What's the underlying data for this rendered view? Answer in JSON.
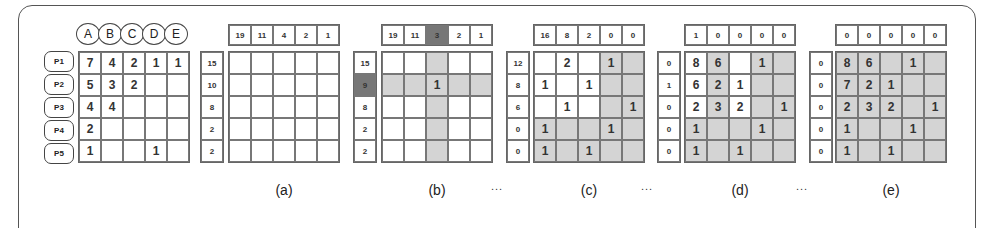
{
  "columns": [
    "A",
    "B",
    "C",
    "D",
    "E"
  ],
  "rows": [
    "P1",
    "P2",
    "P3",
    "P4",
    "P5"
  ],
  "input_matrix": [
    [
      "7",
      "4",
      "2",
      "1",
      "1"
    ],
    [
      "5",
      "3",
      "2",
      "",
      ""
    ],
    [
      "4",
      "4",
      "",
      "",
      ""
    ],
    [
      "2",
      "",
      "",
      "",
      ""
    ],
    [
      "1",
      "",
      "",
      "1",
      ""
    ]
  ],
  "panels": [
    {
      "label": "(a)",
      "col_sums": [
        "19",
        "11",
        "4",
        "2",
        "1"
      ],
      "row_sums": [
        "15",
        "10",
        "8",
        "2",
        "2"
      ],
      "col_highlight": -1,
      "row_highlight": -1,
      "cells": [
        [
          "",
          "",
          "",
          "",
          ""
        ],
        [
          "",
          "",
          "",
          "",
          ""
        ],
        [
          "",
          "",
          "",
          "",
          ""
        ],
        [
          "",
          "",
          "",
          "",
          ""
        ],
        [
          "",
          "",
          "",
          "",
          ""
        ]
      ],
      "shaded": [
        [
          0,
          0,
          0,
          0,
          0
        ],
        [
          0,
          0,
          0,
          0,
          0
        ],
        [
          0,
          0,
          0,
          0,
          0
        ],
        [
          0,
          0,
          0,
          0,
          0
        ],
        [
          0,
          0,
          0,
          0,
          0
        ]
      ]
    },
    {
      "label": "(b)",
      "col_sums": [
        "19",
        "11",
        "3",
        "2",
        "1"
      ],
      "row_sums": [
        "15",
        "9",
        "8",
        "2",
        "2"
      ],
      "col_highlight": 2,
      "row_highlight": 1,
      "cells": [
        [
          "",
          "",
          "",
          "",
          ""
        ],
        [
          "",
          "",
          "1",
          "",
          ""
        ],
        [
          "",
          "",
          "",
          "",
          ""
        ],
        [
          "",
          "",
          "",
          "",
          ""
        ],
        [
          "",
          "",
          "",
          "",
          ""
        ]
      ],
      "shaded": [
        [
          0,
          0,
          1,
          0,
          0
        ],
        [
          1,
          1,
          1,
          1,
          1
        ],
        [
          0,
          0,
          1,
          0,
          0
        ],
        [
          0,
          0,
          1,
          0,
          0
        ],
        [
          0,
          0,
          1,
          0,
          0
        ]
      ]
    },
    {
      "label": "(c)",
      "col_sums": [
        "16",
        "8",
        "2",
        "0",
        "0"
      ],
      "row_sums": [
        "12",
        "8",
        "6",
        "0",
        "0"
      ],
      "col_highlight": -1,
      "row_highlight": -1,
      "cells": [
        [
          "",
          "2",
          "",
          "1",
          ""
        ],
        [
          "1",
          "",
          "1",
          "",
          ""
        ],
        [
          "",
          "1",
          "",
          "",
          "1"
        ],
        [
          "1",
          "",
          "",
          "1",
          ""
        ],
        [
          "1",
          "",
          "1",
          "",
          ""
        ]
      ],
      "shaded": [
        [
          0,
          0,
          0,
          1,
          1
        ],
        [
          0,
          0,
          0,
          1,
          1
        ],
        [
          0,
          0,
          0,
          1,
          1
        ],
        [
          1,
          1,
          1,
          1,
          1
        ],
        [
          1,
          1,
          1,
          1,
          1
        ]
      ]
    },
    {
      "label": "(d)",
      "col_sums": [
        "1",
        "0",
        "0",
        "0",
        "0"
      ],
      "row_sums": [
        "0",
        "1",
        "0",
        "0",
        "0"
      ],
      "col_highlight": -1,
      "row_highlight": -1,
      "cells": [
        [
          "8",
          "6",
          "",
          "1",
          ""
        ],
        [
          "6",
          "2",
          "1",
          "",
          ""
        ],
        [
          "2",
          "3",
          "2",
          "",
          "1"
        ],
        [
          "1",
          "",
          "",
          "1",
          ""
        ],
        [
          "1",
          "",
          "1",
          "",
          ""
        ]
      ],
      "shaded": [
        [
          0,
          1,
          0,
          1,
          1
        ],
        [
          0,
          1,
          0,
          1,
          1
        ],
        [
          0,
          1,
          0,
          1,
          1
        ],
        [
          1,
          1,
          1,
          1,
          1
        ],
        [
          1,
          1,
          1,
          1,
          1
        ]
      ]
    },
    {
      "label": "(e)",
      "col_sums": [
        "0",
        "0",
        "0",
        "0",
        "0"
      ],
      "row_sums": [
        "0",
        "0",
        "0",
        "0",
        "0"
      ],
      "col_highlight": -1,
      "row_highlight": -1,
      "cells": [
        [
          "8",
          "6",
          "",
          "1",
          ""
        ],
        [
          "7",
          "2",
          "1",
          "",
          ""
        ],
        [
          "2",
          "3",
          "2",
          "",
          "1"
        ],
        [
          "1",
          "",
          "",
          "1",
          ""
        ],
        [
          "1",
          "",
          "1",
          "",
          ""
        ]
      ],
      "shaded": [
        [
          1,
          1,
          1,
          1,
          1
        ],
        [
          1,
          1,
          1,
          1,
          1
        ],
        [
          1,
          1,
          1,
          1,
          1
        ],
        [
          1,
          1,
          1,
          1,
          1
        ],
        [
          1,
          1,
          1,
          1,
          1
        ]
      ]
    }
  ],
  "ellipsis": "...",
  "colors": {
    "shade": "#d4d4d4",
    "highlight": "#777777",
    "border": "#666666"
  }
}
